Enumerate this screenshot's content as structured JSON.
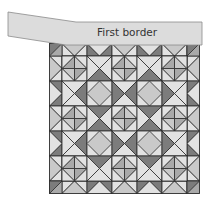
{
  "diagram": {
    "border_label": "First border",
    "colors": {
      "light": "#e2e2e2",
      "light_medium": "#c9c9c9",
      "medium": "#a9a9a9",
      "dark": "#7c7c7c",
      "line": "#2a2a2a",
      "border_strip_fill": "#dcdcdc",
      "border_strip_stroke": "#8a8a8a",
      "text": "#333333"
    },
    "quilt": {
      "grid_size": 5,
      "block_px": 25,
      "frame_px": 12.5,
      "origin": [
        49.5,
        43.5
      ],
      "blocks": [
        [
          "divided-diamond",
          "connector-S",
          "divided-diamond",
          "connector-S",
          "divided-diamond"
        ],
        [
          "connector-E",
          "big-diamond",
          "connector-EW",
          "big-diamond",
          "connector-W"
        ],
        [
          "divided-diamond",
          "connector-NS",
          "divided-diamond",
          "connector-NS",
          "divided-diamond"
        ],
        [
          "connector-E",
          "big-diamond",
          "connector-EW",
          "big-diamond",
          "connector-W"
        ],
        [
          "divided-diamond",
          "connector-N",
          "divided-diamond",
          "connector-N",
          "divided-diamond"
        ]
      ],
      "frame_pattern": [
        "light-peak",
        "dark-valley",
        "light-peak",
        "dark-valley",
        "light-peak"
      ]
    }
  }
}
